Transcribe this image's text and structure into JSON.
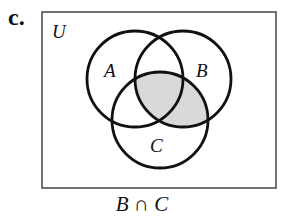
{
  "figure": {
    "part_label": "c.",
    "universe_label": "U",
    "caption": "B ∩ C",
    "sets": [
      {
        "name": "A",
        "cx": 135,
        "cy": 79,
        "r": 48
      },
      {
        "name": "B",
        "cx": 183,
        "cy": 79,
        "r": 48
      },
      {
        "name": "C",
        "cx": 160,
        "cy": 120,
        "r": 48
      }
    ],
    "shaded_region": "B ∩ C",
    "colors": {
      "stroke": "#111111",
      "shade": "#d9d9d9",
      "frame": "#444444"
    }
  }
}
